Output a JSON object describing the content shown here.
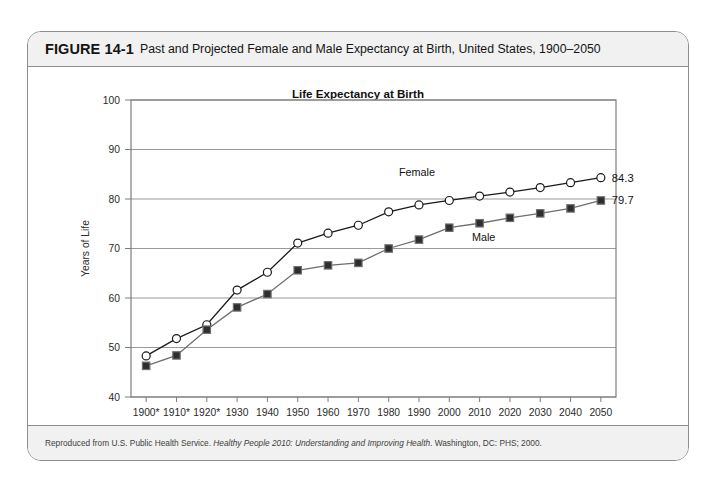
{
  "figure": {
    "number": "FIGURE 14-1",
    "caption": "Past and Projected Female and Male Expectancy at Birth, United States, 1900–2050",
    "source_prefix": "Reproduced from U.S. Public Health Service. ",
    "source_italic": "Healthy People 2010: Understanding and Improving Health",
    "source_suffix": ". Washington, DC: PHS; 2000."
  },
  "chart_data": {
    "type": "line",
    "title": "Life Expectancy at Birth",
    "xlabel": "",
    "ylabel": "Years of Life",
    "categories": [
      "1900*",
      "1910*",
      "1920*",
      "1930",
      "1940",
      "1950",
      "1960",
      "1970",
      "1980",
      "1990",
      "2000",
      "2010",
      "2020",
      "2030",
      "2040",
      "2050"
    ],
    "ylim": [
      40,
      100
    ],
    "yticks": [
      40,
      50,
      60,
      70,
      80,
      90,
      100
    ],
    "grid": true,
    "legend_position": "inline-annotations",
    "series": [
      {
        "name": "Female",
        "marker": "open-circle",
        "color": "#1a1a1a",
        "end_label": "84.3",
        "values": [
          48.3,
          51.8,
          54.6,
          61.6,
          65.2,
          71.1,
          73.1,
          74.7,
          77.4,
          78.8,
          79.7,
          80.6,
          81.4,
          82.3,
          83.3,
          84.3
        ]
      },
      {
        "name": "Male",
        "marker": "filled-square",
        "color": "#6e6e6e",
        "end_label": "79.7",
        "values": [
          46.3,
          48.4,
          53.6,
          58.1,
          60.8,
          65.6,
          66.6,
          67.1,
          70.0,
          71.8,
          74.2,
          75.1,
          76.2,
          77.1,
          78.1,
          79.7
        ]
      }
    ],
    "annotations": [
      {
        "text": "Female",
        "series": "Female"
      },
      {
        "text": "Male",
        "series": "Male"
      }
    ]
  }
}
